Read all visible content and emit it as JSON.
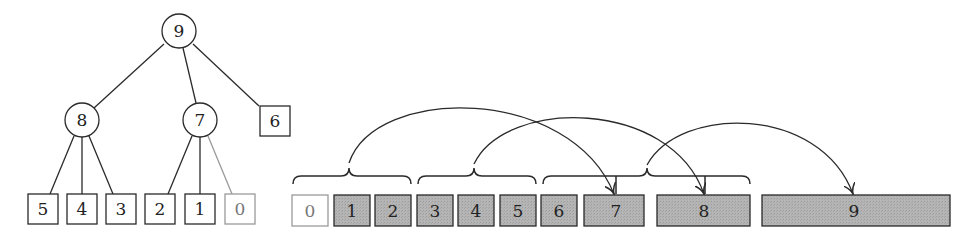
{
  "colors": {
    "stroke": "#2a2a2a",
    "light_stroke": "#9a9a9a",
    "filled_box": "#b3b3b3",
    "empty_box": "#ffffff"
  },
  "tree": {
    "root": {
      "label": "9",
      "shape": "circle",
      "cx": 175,
      "cy": 31,
      "r": 17
    },
    "internal": [
      {
        "label": "8",
        "shape": "circle",
        "cx": 81,
        "cy": 120,
        "r": 17
      },
      {
        "label": "7",
        "shape": "circle",
        "cx": 199,
        "cy": 120,
        "r": 17
      },
      {
        "label": "6",
        "shape": "square",
        "x": 260,
        "y": 106,
        "w": 30,
        "h": 30
      }
    ],
    "leaves": [
      {
        "label": "5",
        "x": 28,
        "y": 194,
        "w": 30,
        "h": 30,
        "light": false
      },
      {
        "label": "4",
        "x": 67,
        "y": 194,
        "w": 30,
        "h": 30,
        "light": false
      },
      {
        "label": "3",
        "x": 106,
        "y": 194,
        "w": 30,
        "h": 30,
        "light": false
      },
      {
        "label": "2",
        "x": 145,
        "y": 194,
        "w": 30,
        "h": 30,
        "light": false
      },
      {
        "label": "1",
        "x": 185,
        "y": 194,
        "w": 30,
        "h": 30,
        "light": false
      },
      {
        "label": "0",
        "x": 225,
        "y": 194,
        "w": 30,
        "h": 30,
        "light": true
      }
    ]
  },
  "array": {
    "cells": [
      {
        "label": "0",
        "x": 292,
        "w": 36,
        "filled": false
      },
      {
        "label": "1",
        "x": 334,
        "w": 36,
        "filled": true
      },
      {
        "label": "2",
        "x": 375,
        "w": 36,
        "filled": true
      },
      {
        "label": "3",
        "x": 417,
        "w": 36,
        "filled": true
      },
      {
        "label": "4",
        "x": 458,
        "w": 36,
        "filled": true
      },
      {
        "label": "5",
        "x": 500,
        "w": 36,
        "filled": true
      },
      {
        "label": "6",
        "x": 541,
        "w": 36,
        "filled": true
      },
      {
        "label": "7",
        "x": 584,
        "w": 60,
        "filled": true
      },
      {
        "label": "8",
        "x": 657,
        "w": 93,
        "filled": true
      },
      {
        "label": "9",
        "x": 762,
        "w": 188,
        "filled": true
      }
    ],
    "cell_y": 195,
    "cell_h": 31,
    "braces": [
      {
        "from": 292,
        "to": 411,
        "cusp": 349,
        "groups_cells": [
          "0",
          "1",
          "2"
        ]
      },
      {
        "from": 417,
        "to": 536,
        "cusp": 474,
        "groups_cells": [
          "3",
          "4",
          "5"
        ]
      },
      {
        "from": 543,
        "to": 750,
        "cusp": 647,
        "groups_cells": [
          "6",
          "7",
          "8"
        ]
      }
    ],
    "arrows": [
      {
        "from_cusp": 349,
        "to_cell": "7",
        "to_x": 614,
        "peak_y": 101
      },
      {
        "from_cusp": 474,
        "to_cell": "8",
        "to_x": 704,
        "peak_y": 112
      },
      {
        "from_cusp": 647,
        "to_cell": "9",
        "to_x": 853,
        "peak_y": 118
      }
    ]
  }
}
